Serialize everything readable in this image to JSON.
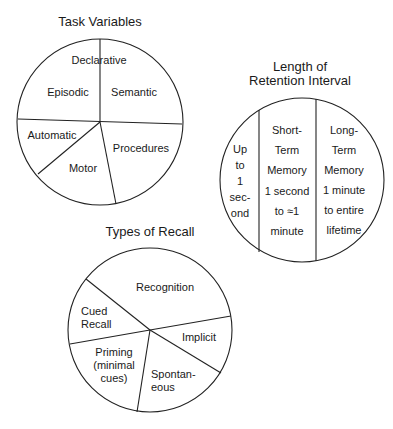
{
  "diagram": {
    "task_variables": {
      "title": "Task Variables",
      "segments": {
        "declarative": "Declarative",
        "episodic": "Episodic",
        "semantic": "Semantic",
        "automatic": "Automatic",
        "motor": "Motor",
        "procedures": "Procedures"
      }
    },
    "retention_interval": {
      "title_line1": "Length of",
      "title_line2": "Retention Interval",
      "segments": {
        "sensory": [
          "Up",
          "to",
          "1",
          "sec-",
          "ond"
        ],
        "short_term": [
          "Short-",
          "Term",
          "Memory",
          "1 second",
          "to ≈1",
          "minute"
        ],
        "long_term": [
          "Long-",
          "Term",
          "Memory",
          "1 minute",
          "to entire",
          "lifetime"
        ]
      }
    },
    "types_of_recall": {
      "title": "Types of Recall",
      "segments": {
        "recognition": "Recognition",
        "cued_recall": [
          "Cued",
          "Recall"
        ],
        "implicit": "Implicit",
        "priming": [
          "Priming",
          "(minimal",
          "cues)"
        ],
        "spontaneous": [
          "Spontan-",
          "eous"
        ]
      }
    }
  }
}
